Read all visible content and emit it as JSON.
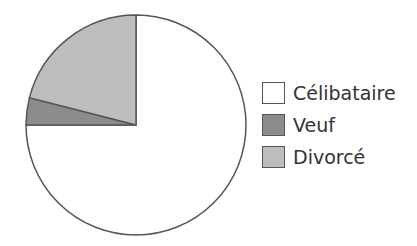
{
  "chart_data": {
    "type": "pie",
    "title": "",
    "categories": [
      "Célibataire",
      "Veuf",
      "Divorcé"
    ],
    "values": [
      75,
      4,
      21
    ],
    "colors": [
      "#ffffff",
      "#8c8c8c",
      "#bdbdbd"
    ],
    "start_angle": "12 o'clock, clockwise",
    "legend_position": "right"
  },
  "legend": {
    "items": [
      {
        "label": "Célibataire",
        "color": "#ffffff"
      },
      {
        "label": "Veuf",
        "color": "#8c8c8c"
      },
      {
        "label": "Divorcé",
        "color": "#bdbdbd"
      }
    ]
  }
}
